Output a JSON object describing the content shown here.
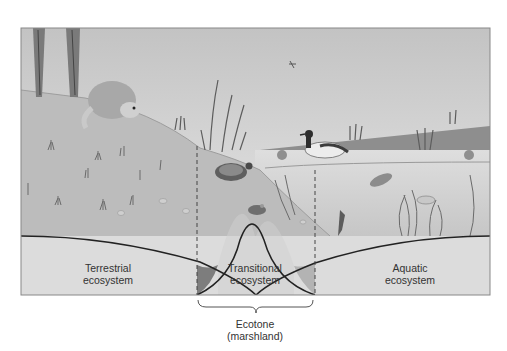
{
  "diagram": {
    "type": "ecotone illustration",
    "regions": [
      {
        "id": "terrestrial",
        "line1": "Terrestrial",
        "line2": "ecosystem"
      },
      {
        "id": "transitional",
        "line1": "Transitional",
        "line2": "ecosystem"
      },
      {
        "id": "aquatic",
        "line1": "Aquatic",
        "line2": "ecosystem"
      }
    ],
    "bracket_label": {
      "line1": "Ecotone",
      "line2": "(marshland)"
    },
    "organisms": [
      "trees",
      "raccoon",
      "grass-tufts",
      "cattails",
      "turtle",
      "frog",
      "duck",
      "dragonfly",
      "water-lilies",
      "fish",
      "submerged-plants"
    ],
    "colors": {
      "sky_top": "#c4c4c4",
      "sky_bottom": "#e6e6e6",
      "land": "#b9b9b9",
      "water": "#d2d2d2",
      "far_shore": "#8e8e8e",
      "band": "#dcdcdc",
      "curve": "#222222",
      "shade_dark": "#7d7d7d",
      "shade_light": "#b3b3b3"
    }
  }
}
